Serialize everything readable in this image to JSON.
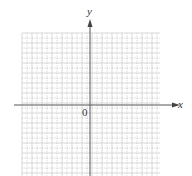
{
  "figure": {
    "type": "coordinate-grid",
    "x_axis_label": "x",
    "y_axis_label": "y",
    "origin_label": "0",
    "grid": {
      "left": 22,
      "top": 33,
      "right": 160,
      "bottom": 176,
      "cell_size": 10,
      "solid_every": 2,
      "origin_px": [
        90,
        105
      ]
    },
    "colors": {
      "axis": "#555555",
      "grid_solid": "#cfcfcf",
      "grid_dotted": "#bdbdbd",
      "text": "#333333"
    }
  }
}
